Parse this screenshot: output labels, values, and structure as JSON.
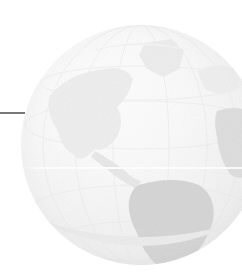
{
  "graphic": {
    "kind": "globe-watermark",
    "description": "Faint pale-grey watermark illustration of the Earth globe showing the Americas",
    "alt_text": "Globe watermark",
    "colors": {
      "background": "#ffffff",
      "sphere_light": "#fdfdfd",
      "sphere_mid": "#f4f4f4",
      "sphere_edge": "#e4e4e4",
      "land_light": "#f2f2f2",
      "land_mid": "#e3e3e3",
      "land_dark": "#d2d2d2",
      "equator_highlight": "#ffffff",
      "rule": "#77777a"
    },
    "globe": {
      "center_x": 141,
      "center_y": 145,
      "diameter": 240,
      "hemisphere": "Western",
      "equator_y": 167,
      "features": [
        {
          "name": "greenland"
        },
        {
          "name": "north-america"
        },
        {
          "name": "central-america"
        },
        {
          "name": "south-america"
        },
        {
          "name": "west-africa"
        },
        {
          "name": "europe"
        },
        {
          "name": "antarctic-rim"
        }
      ]
    },
    "leader_rule": {
      "x": 0,
      "y": 112,
      "length": 25,
      "thickness": 2,
      "color": "#77777a"
    }
  }
}
